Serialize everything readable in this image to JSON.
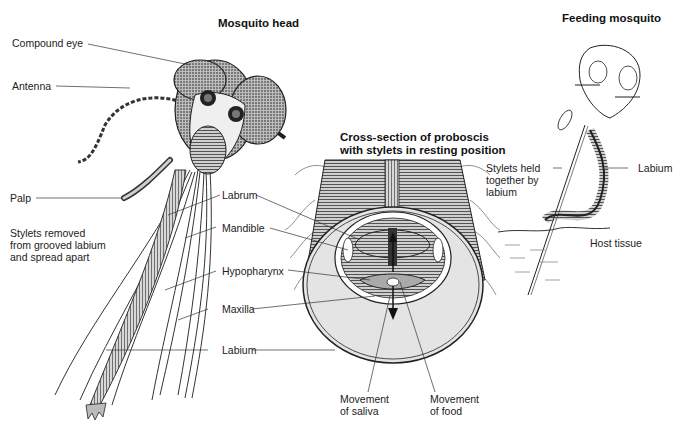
{
  "titles": {
    "head": "Mosquito head",
    "cross_section_line1": "Cross-section of proboscis",
    "cross_section_line2": "with stylets in resting position",
    "feeding": "Feeding mosquito"
  },
  "head_labels": {
    "compound_eye": "Compound eye",
    "antenna": "Antenna",
    "palp": "Palp",
    "stylets_line1": "Stylets removed",
    "stylets_line2": "from grooved labium",
    "stylets_line3": "and spread apart"
  },
  "center_labels": {
    "labrum": "Labrum",
    "mandible": "Mandible",
    "hypopharynx": "Hypopharynx",
    "maxilla": "Maxilla",
    "labium": "Labium"
  },
  "cross_section_labels": {
    "saliva_line1": "Movement",
    "saliva_line2": "of saliva",
    "food_line1": "Movement",
    "food_line2": "of food"
  },
  "feeding_labels": {
    "stylets_line1": "Stylets held",
    "stylets_line2": "together by",
    "stylets_line3": "labium",
    "labium": "Labium",
    "host_tissue": "Host tissue"
  },
  "colors": {
    "ink": "#1a1a1a",
    "shade": "#555555",
    "fill_light": "#e4e4e4",
    "background": "#ffffff"
  }
}
